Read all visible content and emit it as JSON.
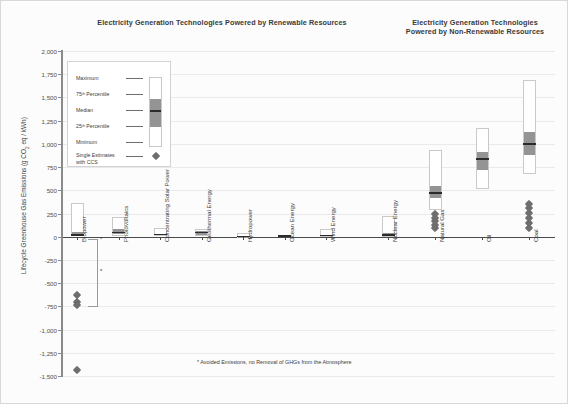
{
  "figure": {
    "footnote": "* Avoided Emissions, no Removal of GHGs from the Atmosphere",
    "biopower_asterisk": "*",
    "biopower_tiny_asterisk": "*"
  },
  "titles": {
    "renewable": "Electricity Generation Technologies Powered by Renewable Resources",
    "nonrenewable_line1": "Electricity Generation Technologies",
    "nonrenewable_line2": "Powered by Non-Renewable Resources"
  },
  "legend": {
    "maximum": "Maximum",
    "p75": "75ᵗʰ Percentile",
    "median": "Median",
    "p25": "25ᵗʰ Percentile",
    "minimum": "Minimum",
    "ccs_line1": "Single Estimates",
    "ccs_line2": "with CCS"
  },
  "chart_data": {
    "type": "boxplot",
    "xlabel": "",
    "ylabel": "Lifecycle Greenhouse Gas Emissions (g CO₂ eq / kWh)",
    "ylim": [
      -1500,
      2000
    ],
    "ytick_step": 250,
    "ytick_labels": [
      "2,000",
      "1,750",
      "1,500",
      "1,250",
      "1,000",
      "750",
      "500",
      "250",
      "0",
      "-250",
      "-500",
      "-750",
      "-1,000",
      "-1,250",
      "-1,500"
    ],
    "ytick_values": [
      2000,
      1750,
      1500,
      1250,
      1000,
      750,
      500,
      250,
      0,
      -250,
      -500,
      -750,
      -1000,
      -1250,
      -1500
    ],
    "grid": true,
    "legend_position": "upper-left-inside",
    "panels": [
      {
        "name": "renewable",
        "title": "Electricity Generation Technologies Powered by Renewable Resources",
        "categories": [
          {
            "label": "Biopower",
            "min": 10,
            "p25": 18,
            "median": 18,
            "p75": 50,
            "max": 360,
            "ccs": [
              -633,
              -700,
              -740,
              -1430
            ]
          },
          {
            "label": "Photovoltaics",
            "min": 5,
            "p25": 30,
            "median": 46,
            "p75": 80,
            "max": 217,
            "ccs": []
          },
          {
            "label": "Concentrating Solar Power",
            "min": 7,
            "p25": 14,
            "median": 22,
            "p75": 32,
            "max": 89,
            "ccs": []
          },
          {
            "label": "Geothermal Energy",
            "min": 6,
            "p25": 20,
            "median": 45,
            "p75": 57,
            "max": 79,
            "ccs": []
          },
          {
            "label": "Hydropower",
            "min": 1,
            "p25": 3,
            "median": 4,
            "p75": 7,
            "max": 43,
            "ccs": []
          },
          {
            "label": "Ocean Energy",
            "min": 2,
            "p25": 6,
            "median": 8,
            "p75": 23,
            "max": 23,
            "ccs": []
          },
          {
            "label": "Wind Energy",
            "min": 2,
            "p25": 8,
            "median": 12,
            "p75": 20,
            "max": 81,
            "ccs": []
          }
        ]
      },
      {
        "name": "nonrenewable",
        "title": "Electricity Generation Technologies Powered by Non-Renewable Resources",
        "categories": [
          {
            "label": "Nuclear Energy",
            "min": 1,
            "p25": 8,
            "median": 16,
            "p75": 45,
            "max": 220,
            "ccs": []
          },
          {
            "label": "Natural Gas",
            "min": 290,
            "p25": 422,
            "median": 469,
            "p75": 548,
            "max": 930,
            "ccs": [
              98,
              126,
              170,
              200,
              245
            ]
          },
          {
            "label": "Oil",
            "min": 510,
            "p25": 722,
            "median": 840,
            "p75": 907,
            "max": 1170,
            "ccs": []
          },
          {
            "label": "Coal",
            "min": 675,
            "p25": 877,
            "median": 1001,
            "p75": 1130,
            "max": 1689,
            "ccs": [
              98,
              145,
              200,
              255,
              310,
              350
            ]
          }
        ]
      }
    ]
  }
}
